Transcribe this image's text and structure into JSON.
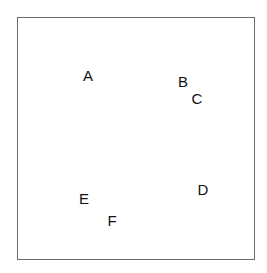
{
  "diagram": {
    "border_color": "#6a6a6a",
    "points": [
      {
        "label": "A",
        "x": 88,
        "y": 75
      },
      {
        "label": "B",
        "x": 183,
        "y": 81
      },
      {
        "label": "C",
        "x": 197,
        "y": 98
      },
      {
        "label": "D",
        "x": 203,
        "y": 189
      },
      {
        "label": "E",
        "x": 84,
        "y": 198
      },
      {
        "label": "F",
        "x": 112,
        "y": 220
      }
    ]
  }
}
